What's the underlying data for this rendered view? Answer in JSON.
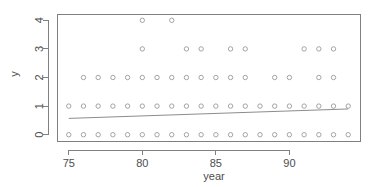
{
  "chart_data": {
    "type": "scatter",
    "title": "",
    "xlabel": "year",
    "ylabel": "y",
    "xlim": [
      74.2,
      94.8
    ],
    "ylim": [
      -0.22,
      4.22
    ],
    "grid": false,
    "legend": null,
    "x_ticks": [
      75,
      80,
      85,
      90
    ],
    "x_tick_labels": [
      "75",
      "80",
      "85",
      "90"
    ],
    "y_ticks": [
      0,
      1,
      2,
      3,
      4
    ],
    "y_tick_labels": [
      "0",
      "1",
      "2",
      "3",
      "4"
    ],
    "point_symbol": "open-circle",
    "point_color": "#9a9a9a",
    "series": [
      {
        "name": "observations",
        "x": [
          75,
          76,
          77,
          78,
          79,
          80,
          81,
          82,
          83,
          84,
          85,
          86,
          87,
          88,
          89,
          90,
          91,
          92,
          93,
          94,
          75,
          76,
          77,
          78,
          79,
          80,
          81,
          82,
          83,
          84,
          85,
          86,
          87,
          88,
          89,
          90,
          91,
          92,
          93,
          94,
          76,
          77,
          78,
          79,
          80,
          81,
          82,
          83,
          84,
          85,
          86,
          87,
          89,
          90,
          92,
          93,
          80,
          83,
          84,
          86,
          87,
          91,
          92,
          93,
          80,
          82
        ],
        "y": [
          0,
          0,
          0,
          0,
          0,
          0,
          0,
          0,
          0,
          0,
          0,
          0,
          0,
          0,
          0,
          0,
          0,
          0,
          0,
          0,
          1,
          1,
          1,
          1,
          1,
          1,
          1,
          1,
          1,
          1,
          1,
          1,
          1,
          1,
          1,
          1,
          1,
          1,
          1,
          1,
          2,
          2,
          2,
          2,
          2,
          2,
          2,
          2,
          2,
          2,
          2,
          2,
          2,
          2,
          2,
          2,
          3,
          3,
          3,
          3,
          3,
          3,
          3,
          3,
          4,
          4
        ]
      }
    ],
    "fit_line": {
      "name": "fitted-line",
      "x_start": 75,
      "x_end": 94,
      "y_start": 0.57,
      "y_end": 0.9,
      "color": "#8c8c8c"
    }
  }
}
